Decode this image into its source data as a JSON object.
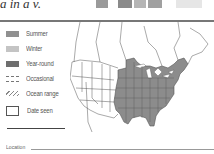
{
  "header": {
    "text_fragment": "a in a v."
  },
  "photo_strip": {
    "colors": [
      "#9a9a9a",
      "#c8c8c8",
      "#8a8a8a",
      "#b5b5b5",
      "#a0a0a0",
      "#d5d5d5",
      "#e6e6e6"
    ]
  },
  "legend": {
    "items": [
      {
        "label": "Summer",
        "icon": "summer-swatch",
        "color": "#909090"
      },
      {
        "label": "Winter",
        "icon": "winter-swatch",
        "color": "#c4c4c4"
      },
      {
        "label": "Year-round",
        "icon": "year-round-swatch",
        "color": "#6e6e6e"
      },
      {
        "label": "Occasional",
        "icon": "occasional-dashed-swatch",
        "color": "#777777"
      },
      {
        "label": "Ocean range",
        "icon": "ocean-range-hatch-swatch",
        "color": "#888888"
      }
    ],
    "date_seen_label": "Date seen"
  },
  "form": {
    "location_label": "Location"
  },
  "map": {
    "range_color": "#8c8c8c",
    "border_color": "#555555",
    "region": "North America"
  }
}
